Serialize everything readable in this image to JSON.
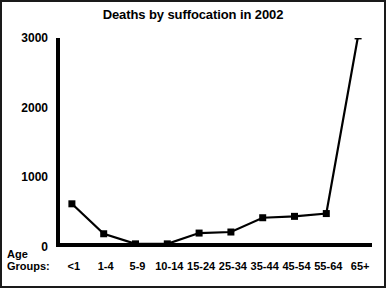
{
  "chart_data": {
    "type": "line",
    "title": "Deaths by suffocation in 2002",
    "xlabel": "Age Groups:",
    "ylabel": "",
    "categories": [
      "<1",
      "1-4",
      "5-9",
      "10-14",
      "15-24",
      "25-34",
      "35-44",
      "45-54",
      "55-64",
      "65+"
    ],
    "values": [
      620,
      190,
      45,
      45,
      200,
      215,
      420,
      440,
      480,
      3030
    ],
    "ylim": [
      0,
      3000
    ],
    "yticks": [
      0,
      1000,
      2000,
      3000
    ],
    "ytick_labels": [
      "0",
      "1000",
      "2000",
      "3000"
    ],
    "grid": false,
    "legend": false,
    "marker": "square",
    "series_color": "#000000",
    "line_color": "#000000",
    "background_color": "#ffffff",
    "border_color": "#1a1a1a"
  },
  "axis_caption": {
    "line1": "Age",
    "line2": "Groups:"
  }
}
